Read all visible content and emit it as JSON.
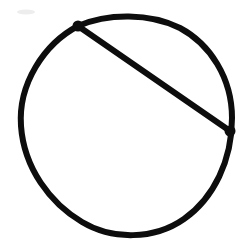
{
  "figure": {
    "kind": "hand-drawn-geometry-diagram",
    "title": "Circle with a chord",
    "background_color": "#ffffff",
    "ink_color": "#0d0d0d",
    "canvas": {
      "width": 242,
      "height": 252
    },
    "labels": [],
    "annotations": [],
    "circle": {
      "name": "main-circle",
      "center_x": 126,
      "center_y": 124,
      "radius_x": 106,
      "radius_y": 111,
      "stroke_width": 6,
      "bounds": {
        "left": 20,
        "top": 13,
        "right": 232,
        "bottom": 235
      },
      "style": "hand-drawn irregular closed curve",
      "path": "M 78 26 C 108 13, 150 13, 180 28 C 210 44, 232 78, 232 118 C 232 160, 214 198, 184 219 C 154 240, 112 240, 82 222 C 50 203, 24 168, 21 126 C 18 84, 44 44, 78 26 Z"
    },
    "chord": {
      "name": "chord-segment",
      "x1": 78,
      "y1": 26,
      "x2": 230,
      "y2": 131,
      "stroke_width": 6,
      "style": "straight diagonal line from upper-left to right",
      "path": "M 78 26 L 230 131"
    },
    "vertices": [
      {
        "name": "chord-endpoint-upper-left",
        "x": 78,
        "y": 26,
        "radius": 5.5,
        "description": "thickened ink blob where chord meets circle at upper left"
      },
      {
        "name": "chord-endpoint-right",
        "x": 230,
        "y": 131,
        "radius": 5.5,
        "description": "thickened ink blob where chord meets circle at right"
      }
    ],
    "smudge": {
      "name": "paper-smudge",
      "x": 26,
      "y": 12,
      "rx": 9,
      "ry": 2.5,
      "color": "#ededed",
      "description": "faint light-gray scanning artifact near top left"
    }
  }
}
